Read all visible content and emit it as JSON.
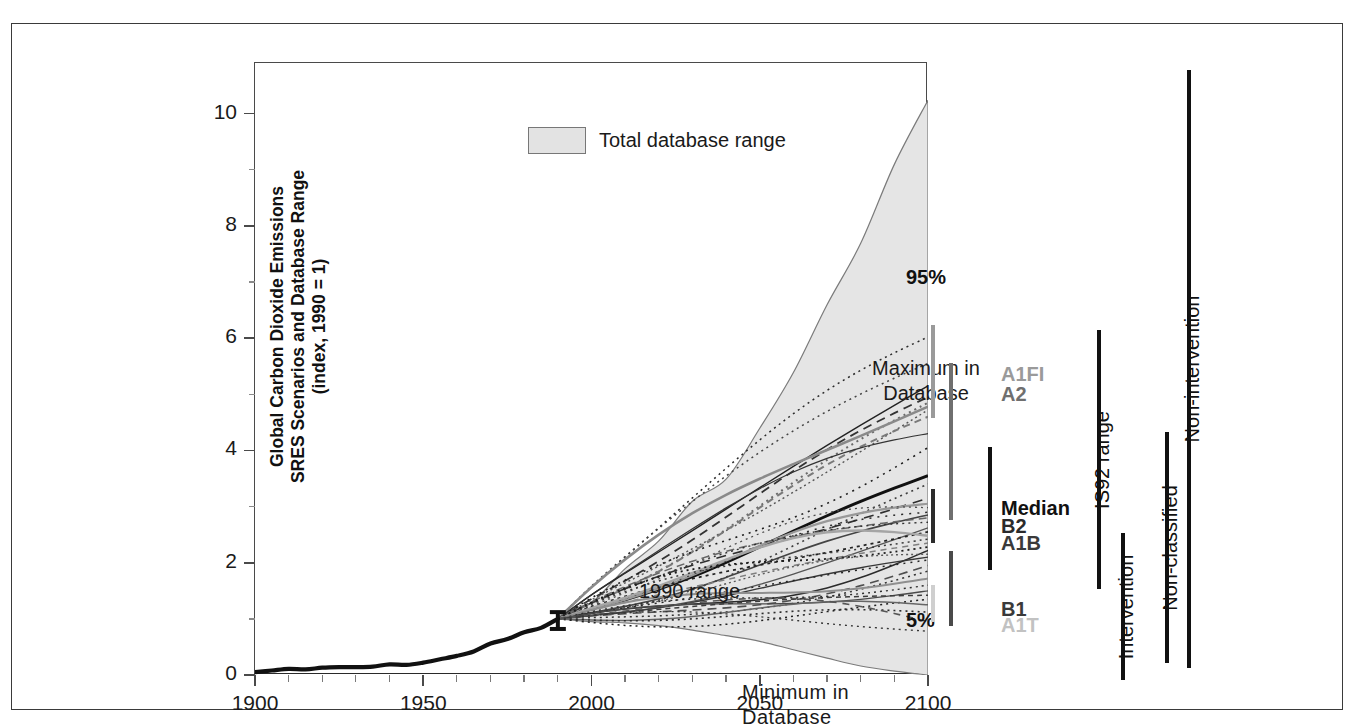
{
  "chart_data": {
    "type": "line",
    "title": "",
    "ylabel": "Global Carbon Dioxide Emissions\nSRES Scenarios and Database Range\n(index, 1990 = 1)",
    "ylabel_lines": [
      "Global Carbon Dioxide Emissions",
      "SRES Scenarios and Database Range",
      "(index, 1990 = 1)"
    ],
    "xlabel": "",
    "xlim": [
      1900,
      2100
    ],
    "ylim": [
      0,
      10.9
    ],
    "xticks": [
      "1900",
      "1950",
      "2000",
      "2050",
      "2100"
    ],
    "xtick_values": [
      1900,
      1950,
      2000,
      2050,
      2100
    ],
    "xminor_step": 10,
    "yticks": [
      "0",
      "2",
      "4",
      "6",
      "8",
      "10"
    ],
    "ytick_values": [
      0,
      2,
      4,
      6,
      8,
      10
    ],
    "yminor_values": [
      1,
      3,
      5,
      7,
      9
    ],
    "grid": false,
    "legend": [
      {
        "label": "Total database range",
        "swatch": "#e3e3e3",
        "position": "top-left-inside"
      }
    ],
    "annotations": [
      {
        "text": "Maximum in\nDatabase",
        "lines": [
          "Maximum in",
          "Database"
        ],
        "x": 2035,
        "y": 6.3
      },
      {
        "text": "1990 range",
        "lines": [
          "1990 range"
        ],
        "x": 1955,
        "y": 2.4
      },
      {
        "text": "Minimum in  Database",
        "lines": [
          "Minimum in  Database"
        ],
        "x": 1992,
        "y": 0.55
      },
      {
        "text": "95%",
        "lines": [
          "95%"
        ],
        "x": 2104,
        "y": 6.5
      },
      {
        "text": "5%",
        "lines": [
          "5%"
        ],
        "x": 2104,
        "y": 0.55
      }
    ],
    "historical_series": {
      "name": "Historical global CO2 emissions",
      "x": [
        1900,
        1905,
        1910,
        1915,
        1920,
        1925,
        1930,
        1935,
        1940,
        1945,
        1950,
        1955,
        1960,
        1965,
        1970,
        1975,
        1980,
        1985,
        1990
      ],
      "y": [
        0.05,
        0.08,
        0.11,
        0.1,
        0.13,
        0.14,
        0.14,
        0.15,
        0.19,
        0.18,
        0.22,
        0.28,
        0.34,
        0.42,
        0.56,
        0.64,
        0.76,
        0.84,
        1.0
      ]
    },
    "range_band": {
      "name": "Total database range",
      "x": [
        1990,
        2000,
        2010,
        2020,
        2030,
        2040,
        2050,
        2060,
        2070,
        2080,
        2090,
        2100
      ],
      "max": [
        1.0,
        1.35,
        1.85,
        2.45,
        3.05,
        3.55,
        4.35,
        5.45,
        6.55,
        7.75,
        9.05,
        10.3
      ],
      "min": [
        1.0,
        0.95,
        0.93,
        0.88,
        0.8,
        0.7,
        0.6,
        0.45,
        0.3,
        0.16,
        0.07,
        0.0
      ]
    },
    "error_bar_1990": {
      "x": 1990,
      "low": 0.82,
      "high": 1.12
    },
    "marker_bars": [
      {
        "column": 1,
        "name": "A1FI",
        "color": "#9a9a9a",
        "top_value": 5.8,
        "bottom_value": 4.15
      },
      {
        "column": 1,
        "name": "Median",
        "color": "#2b2b2b",
        "top_value": 2.88,
        "bottom_value": 1.92
      },
      {
        "column": 1,
        "name": "A1T",
        "color": "#cfcfcf",
        "top_value": 1.18,
        "bottom_value": 0.52
      },
      {
        "column": 2,
        "name": "A2",
        "color": "#6f6f6f",
        "top_value": 5.13,
        "bottom_value": 2.33
      },
      {
        "column": 2,
        "name": "B1",
        "color": "#4a4a4a",
        "top_value": 1.78,
        "bottom_value": 0.45
      },
      {
        "column": 3,
        "name": "Median B2 A1B",
        "color": "#111111",
        "top_value": 3.63,
        "bottom_value": 1.45
      }
    ],
    "scenario_labels": [
      {
        "text": "A1FI",
        "color": "#9a9a9a",
        "value": 4.9
      },
      {
        "text": "A2",
        "color": "#6f6f6f",
        "value": 4.55
      },
      {
        "text": "Median",
        "color": "#111111",
        "value": 2.52
      },
      {
        "text": "B2",
        "color": "#2b2b2b",
        "value": 2.19
      },
      {
        "text": "A1B",
        "color": "#3a3a3a",
        "value": 1.88
      },
      {
        "text": "B1",
        "color": "#3a3a3a",
        "value": 0.72
      },
      {
        "text": "A1T",
        "color": "#c2c2c2",
        "value": 0.42
      }
    ],
    "right_range_bars": [
      {
        "label": "IS92 range",
        "color": "#111111",
        "top_value": 5.72,
        "bottom_value": 1.1
      },
      {
        "label": "Intervention",
        "color": "#111111",
        "top_value": 2.1,
        "bottom_value": -0.52
      },
      {
        "label": "Non-classified",
        "color": "#111111",
        "top_value": 3.9,
        "bottom_value": -0.22
      },
      {
        "label": "Non-intervention",
        "color": "#111111",
        "top_value": 10.35,
        "bottom_value": -0.3
      }
    ]
  },
  "colors": {
    "band_fill": "#e5e5e5",
    "band_stroke": "#7b7b7b",
    "axis": "#4a4a4a",
    "text": "#1a1a1a",
    "frame": "#3a3a3a"
  }
}
